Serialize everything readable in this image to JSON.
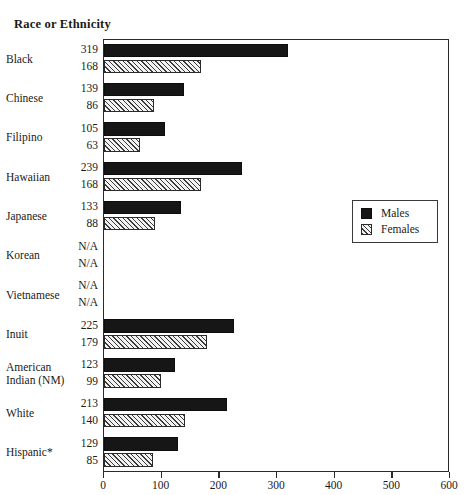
{
  "chart_data": {
    "type": "bar",
    "orientation": "horizontal",
    "title": "Race or Ethnicity",
    "xlabel": "",
    "ylabel": "",
    "xlim": [
      0,
      600
    ],
    "xticks": [
      0,
      100,
      200,
      300,
      400,
      500,
      600
    ],
    "xtick_labels": [
      "0",
      "100",
      "200",
      "300",
      "400",
      "500",
      "600"
    ],
    "grid": false,
    "legend_position": "right-middle",
    "categories": [
      "Black",
      "Chinese",
      "Filipino",
      "Hawaiian",
      "Japanese",
      "Korean",
      "Vietnamese",
      "Inuit",
      "American Indian (NM)",
      "White",
      "Hispanic*"
    ],
    "series": [
      {
        "name": "Males",
        "color": "#161616",
        "fill": "solid",
        "values": [
          319,
          139,
          105,
          239,
          133,
          null,
          null,
          225,
          123,
          213,
          129
        ],
        "value_labels": [
          "319",
          "139",
          "105",
          "239",
          "133",
          "N/A",
          "N/A",
          "225",
          "123",
          "213",
          "129"
        ]
      },
      {
        "name": "Females",
        "color": "#3a3a3a",
        "fill": "diagonal-hatch",
        "values": [
          168,
          86,
          63,
          168,
          88,
          null,
          null,
          179,
          99,
          140,
          85
        ],
        "value_labels": [
          "168",
          "86",
          "63",
          "168",
          "88",
          "N/A",
          "N/A",
          "179",
          "99",
          "140",
          "85"
        ]
      }
    ]
  },
  "legend": {
    "items": [
      {
        "label": "Males",
        "swatch": "solid-black"
      },
      {
        "label": "Females",
        "swatch": "hatched"
      }
    ]
  },
  "colors": {
    "male_bar": "#161616",
    "female_hatch": "#3a3a3a",
    "female_fill": "#f2f2f2",
    "axis": "#2a2a2a",
    "text": "#1a1a1a",
    "background": "#ffffff"
  }
}
